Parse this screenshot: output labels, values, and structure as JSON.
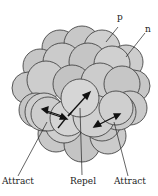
{
  "diagram": {
    "labels": {
      "proton": "p",
      "neutron": "n",
      "attract_left": "Attract",
      "repel": "Repel",
      "attract_right": "Attract"
    },
    "colors": {
      "nucleon_fill": "#c8c8c8",
      "nucleon_fill_light": "#dadada",
      "outline": "#333333",
      "arrow": "#111111"
    }
  }
}
